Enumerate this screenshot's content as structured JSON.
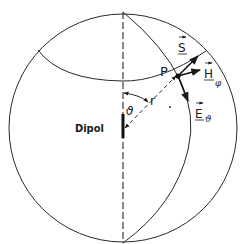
{
  "figure": {
    "labels": {
      "dipole": "Dipol",
      "point": "P",
      "radius": "r",
      "theta": "ϑ",
      "poynting": "S",
      "magnetic": "H",
      "magnetic_sub": "φ",
      "electric": "E",
      "electric_sub": "ϑ"
    },
    "colors": {
      "line": "#2a2a2a",
      "background": "#ffffff"
    }
  }
}
